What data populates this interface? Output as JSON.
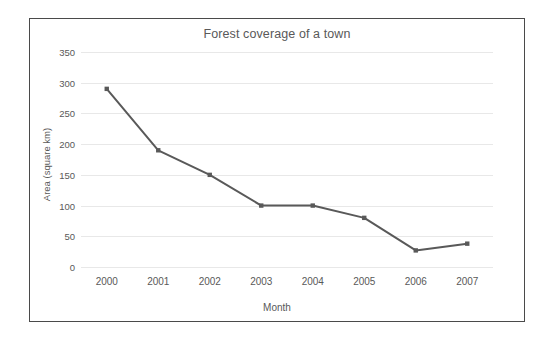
{
  "chart_data": {
    "type": "line",
    "title": "Forest coverage of a town",
    "xlabel": "Month",
    "ylabel": "Area (square km)",
    "categories": [
      "2000",
      "2001",
      "2002",
      "2003",
      "2004",
      "2005",
      "2006",
      "2007"
    ],
    "values": [
      290,
      190,
      150,
      100,
      100,
      80,
      27,
      38
    ],
    "series": [
      {
        "name": "Forest coverage",
        "values": [
          290,
          190,
          150,
          100,
          100,
          80,
          27,
          38
        ]
      }
    ],
    "yticks": [
      0,
      50,
      100,
      150,
      200,
      250,
      300,
      350
    ],
    "ylim": [
      0,
      350
    ],
    "grid": "horizontal",
    "legend": "none",
    "line_color": "#595959",
    "marker_color": "#595959",
    "gridline_color": "#e8e8e8",
    "text_color": "#595959",
    "frame_color": "#4a4a4a",
    "background": "#ffffff"
  }
}
